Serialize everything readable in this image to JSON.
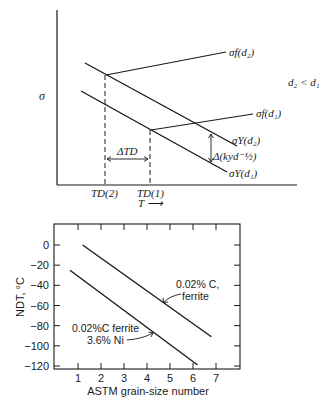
{
  "top_diagram": {
    "y_axis_label": "σ",
    "x_axis_label": "T ⟶",
    "condition_label": "d₂ < d₁",
    "labels": {
      "sigma_f_d2": "σf(d₂)",
      "sigma_f_d1": "σf(d₁)",
      "sigma_y_d2": "σY(d₂)",
      "sigma_y_d1": "σY(d₁)",
      "delta_k": "Δ(kyd⁻½)",
      "delta_td": "ΔTD",
      "td2": "TD(2)",
      "td1": "TD(1)"
    }
  },
  "chart_data": {
    "type": "line",
    "title": "",
    "xlabel": "ASTM grain-size number",
    "ylabel": "NDT, °C",
    "xlim": [
      0.3,
      8.1
    ],
    "ylim": [
      -122,
      20
    ],
    "xticks": [
      1,
      2,
      3,
      4,
      5,
      6,
      7
    ],
    "yticks": [
      0,
      -20,
      -40,
      -60,
      -80,
      -100,
      -120
    ],
    "grid": false,
    "series": [
      {
        "name": "0.02% C, ferrite",
        "x": [
          1.2,
          6.8
        ],
        "y": [
          0,
          -91
        ]
      },
      {
        "name": "0.02% C ferrite 3.6% Ni",
        "x": [
          0.65,
          6.2
        ],
        "y": [
          -25,
          -119
        ]
      }
    ],
    "annotations": [
      {
        "lines": [
          "0.02% C,",
          "ferrite"
        ],
        "series": 0
      },
      {
        "lines": [
          "0.02%C ferrite",
          "3.6% Ni"
        ],
        "series": 1
      }
    ]
  }
}
